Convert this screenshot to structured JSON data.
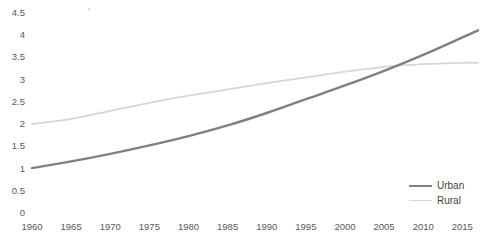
{
  "chart_data": {
    "type": "line",
    "title": "",
    "subtitle": "",
    "xlabel": "",
    "ylabel": "",
    "xlim": [
      1960,
      2017
    ],
    "ylim": [
      0,
      4.5
    ],
    "grid": false,
    "legend_position": "bottom-right",
    "x_tick_labels": [
      "1960",
      "1965",
      "1970",
      "1975",
      "1980",
      "1985",
      "1990",
      "1995",
      "2000",
      "2005",
      "2010",
      "2015"
    ],
    "x_ticks": [
      1960,
      1965,
      1970,
      1975,
      1980,
      1985,
      1990,
      1995,
      2000,
      2005,
      2010,
      2015
    ],
    "y_tick_labels": [
      "0",
      "0.5",
      "1",
      "1.5",
      "2",
      "2.5",
      "3",
      "3.5",
      "4",
      "4.5"
    ],
    "y_ticks": [
      0,
      0.5,
      1,
      1.5,
      2,
      2.5,
      3,
      3.5,
      4,
      4.5
    ],
    "x": [
      1960,
      1965,
      1970,
      1975,
      1980,
      1985,
      1990,
      1995,
      2000,
      2005,
      2010,
      2015,
      2017
    ],
    "series": [
      {
        "name": "Urban",
        "color": "#808080",
        "line_width": 2.4,
        "values": [
          1.01,
          1.16,
          1.33,
          1.52,
          1.73,
          1.97,
          2.25,
          2.56,
          2.87,
          3.2,
          3.56,
          3.95,
          4.11
        ]
      },
      {
        "name": "Rural",
        "color": "#d6d6d6",
        "line_width": 1.8,
        "values": [
          2.0,
          2.12,
          2.3,
          2.48,
          2.64,
          2.78,
          2.92,
          3.05,
          3.18,
          3.29,
          3.35,
          3.38,
          3.38
        ]
      }
    ]
  },
  "legend": {
    "items": [
      {
        "label": "Urban",
        "color": "#808080"
      },
      {
        "label": "Rural",
        "color": "#d6d6d6"
      }
    ]
  },
  "colors": {
    "background": "#ffffff",
    "tick_text": "#595959",
    "legend_text": "#3f3f3f",
    "urban": "#808080",
    "rural": "#d6d6d6"
  }
}
